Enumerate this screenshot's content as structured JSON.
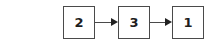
{
  "diagram": {
    "type": "flow",
    "nodes": [
      {
        "id": "n1",
        "label": "2"
      },
      {
        "id": "n2",
        "label": "3"
      },
      {
        "id": "n3",
        "label": "1"
      }
    ],
    "edges": [
      {
        "from": "n1",
        "to": "n2",
        "arrow": "right"
      },
      {
        "from": "n2",
        "to": "n3",
        "arrow": "right"
      }
    ],
    "colors": {
      "border": "#4a4a4a",
      "text": "#1e1e1e",
      "arrow": "#222222",
      "background": "#ffffff"
    }
  }
}
